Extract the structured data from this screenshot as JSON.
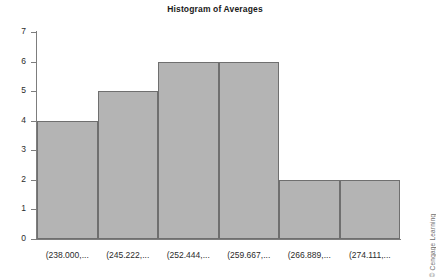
{
  "chart_data": {
    "type": "bar",
    "title": "Histogram of Averages",
    "xlabel": "",
    "ylabel": "",
    "ylim": [
      0,
      7
    ],
    "grid": false,
    "legend": "none",
    "categories": [
      "(238.000,...",
      "(245.222,...",
      "(252.444,...",
      "(259.667,...",
      "(266.889,...",
      "(274.111,..."
    ],
    "values": [
      4,
      5,
      6,
      6,
      2,
      2
    ],
    "y_ticks": [
      "0",
      "1",
      "2",
      "3",
      "4",
      "5",
      "6",
      "7"
    ],
    "bar_fill_color": "#b4b4b4",
    "bar_edge_color": "#6f6f6f",
    "axis_color": "#7d7d7d"
  },
  "watermark": {
    "text": "© Cengage Learning"
  }
}
